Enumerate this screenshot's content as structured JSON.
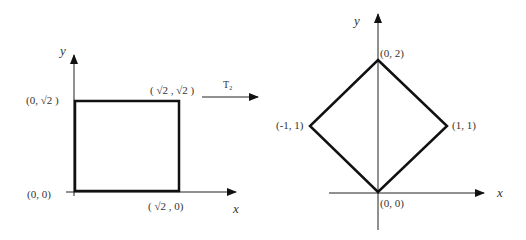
{
  "left": {
    "axis_x": "x",
    "axis_y": "y",
    "labels": {
      "origin": "(0, 0)",
      "top_left": "(0, √2 )",
      "top_right": "( √2 , √2 )",
      "bottom_right": "( √2 , 0)"
    }
  },
  "transform": {
    "label": "T₂"
  },
  "right": {
    "axis_x": "x",
    "axis_y": "y",
    "labels": {
      "top": "(0, 2)",
      "left": "(-1, 1)",
      "right": "(1, 1)",
      "bottom": "(0, 0)"
    }
  }
}
